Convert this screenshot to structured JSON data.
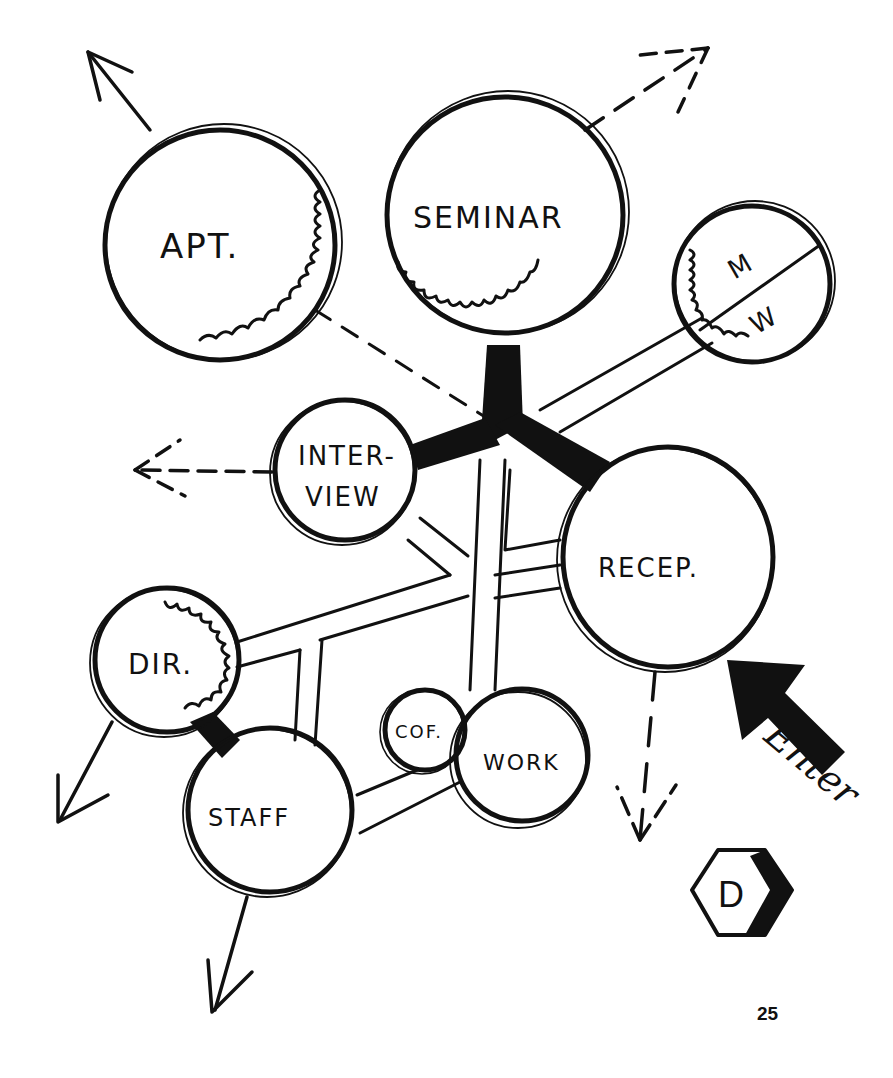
{
  "diagram": {
    "type": "bubble-diagram",
    "ink_color": "#111111",
    "background": "#ffffff",
    "nodes": [
      {
        "id": "apt",
        "label": "APT.",
        "cx": 220,
        "cy": 245,
        "r": 115,
        "privacy_edge": true
      },
      {
        "id": "seminar",
        "label": "SEMINAR",
        "cx": 505,
        "cy": 215,
        "r": 118,
        "privacy_edge": true
      },
      {
        "id": "mw",
        "label_top": "M",
        "label_bottom": "W",
        "cx": 752,
        "cy": 284,
        "r": 78,
        "divided": true,
        "privacy_edge": true
      },
      {
        "id": "interview",
        "label_line1": "INTER-",
        "label_line2": "VIEW",
        "cx": 345,
        "cy": 470,
        "r": 70
      },
      {
        "id": "recep",
        "label": "RECEP.",
        "cx": 668,
        "cy": 557,
        "r": 108
      },
      {
        "id": "dir",
        "label": "DIR.",
        "cx": 167,
        "cy": 660,
        "r": 72,
        "privacy_edge": true
      },
      {
        "id": "staff",
        "label": "STAFF",
        "cx": 270,
        "cy": 810,
        "r": 82
      },
      {
        "id": "cof",
        "label": "COF.",
        "cx": 425,
        "cy": 730,
        "r": 40
      },
      {
        "id": "work",
        "label": "WORK",
        "cx": 522,
        "cy": 755,
        "r": 66
      }
    ],
    "strong_links": [
      {
        "from": "seminar",
        "to": "hub"
      },
      {
        "from": "interview",
        "to": "hub"
      },
      {
        "from": "recep",
        "to": "hub"
      },
      {
        "from": "dir",
        "to": "staff"
      }
    ],
    "corridors": [
      {
        "from": "hub",
        "to": "mw"
      },
      {
        "from": "hub",
        "to": "work"
      },
      {
        "from": "interview",
        "to": "spine"
      },
      {
        "from": "dir",
        "to": "recep"
      },
      {
        "from": "staff",
        "to": "corridor"
      },
      {
        "from": "staff",
        "to": "work"
      }
    ],
    "dashed_links": [
      {
        "from": "apt",
        "to": "hub"
      }
    ],
    "exits": [
      {
        "from": "apt",
        "direction": "up-left",
        "style": "solid"
      },
      {
        "from": "seminar",
        "direction": "up-right",
        "style": "dashed"
      },
      {
        "from": "interview",
        "direction": "left",
        "style": "dashed"
      },
      {
        "from": "recep",
        "direction": "down",
        "style": "dashed"
      },
      {
        "from": "dir",
        "direction": "down-left",
        "style": "solid"
      },
      {
        "from": "staff",
        "direction": "down",
        "style": "solid"
      }
    ],
    "entry": {
      "label": "Enter",
      "direction": "up-left",
      "target": "recep"
    },
    "badge": {
      "letter": "D",
      "shape": "hexagon"
    },
    "page_number": "25"
  }
}
